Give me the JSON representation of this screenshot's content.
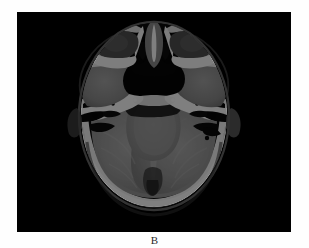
{
  "figure": {
    "panel_label": "B",
    "caption_position": "below",
    "modality": "CT",
    "view": "axial",
    "body_region": "head-skull-base",
    "background_color": "#ffffff",
    "panel_background_color": "#000000"
  },
  "panel": {
    "x": 17,
    "y": 12,
    "width": 274,
    "height": 220
  },
  "image_content": {
    "description": "Axial non-contrast CT of the head at the level of the skull base and posterior fossa",
    "window": "brain-and-bone",
    "orientation_note": "patient left on image right",
    "structures": [
      {
        "name": "scalp-soft-tissue-rim",
        "density": "soft-tissue",
        "tone": "#3a3a3a"
      },
      {
        "name": "frontal-nasal-bone",
        "density": "bone",
        "tone": "#f5f5f5"
      },
      {
        "name": "nasal-cavity-air",
        "density": "air",
        "tone": "#050505"
      },
      {
        "name": "ethmoid-air-cells",
        "density": "air",
        "tone": "#0a0a0a"
      },
      {
        "name": "left-orbit-globe",
        "density": "soft-tissue",
        "tone": "#545454"
      },
      {
        "name": "right-orbit-globe",
        "density": "soft-tissue",
        "tone": "#545454"
      },
      {
        "name": "sphenoid-sinus-air",
        "density": "air",
        "tone": "#060606"
      },
      {
        "name": "left-temporal-lobe",
        "density": "brain",
        "tone": "#8e8e8e"
      },
      {
        "name": "right-temporal-lobe",
        "density": "brain",
        "tone": "#8e8e8e"
      },
      {
        "name": "left-petrous-temporal-bone",
        "density": "bone",
        "tone": "#fafafa"
      },
      {
        "name": "right-petrous-temporal-bone",
        "density": "bone",
        "tone": "#fafafa"
      },
      {
        "name": "left-mastoid-air-cells",
        "density": "air",
        "tone": "#080808"
      },
      {
        "name": "right-mastoid-air-cells",
        "density": "air",
        "tone": "#080808"
      },
      {
        "name": "brainstem-pons",
        "density": "brain",
        "tone": "#969696"
      },
      {
        "name": "fourth-ventricle",
        "density": "csf",
        "tone": "#6a6a6a"
      },
      {
        "name": "left-cerebellar-hemisphere",
        "density": "brain",
        "tone": "#9c9c9c"
      },
      {
        "name": "right-cerebellar-hemisphere",
        "density": "brain",
        "tone": "#9c9c9c"
      },
      {
        "name": "occipital-bone",
        "density": "bone",
        "tone": "#fbfbfb"
      },
      {
        "name": "prepontine-cistern",
        "density": "csf",
        "tone": "#2a2a2a"
      }
    ],
    "tones": {
      "air": "#040404",
      "csf": "#5c5c5c",
      "brain_gray": "#9a9a9a",
      "brain_white": "#8a8a8a",
      "soft_tissue": "#4a4a4a",
      "bone": "#f8f8f8",
      "scalp": "#333333"
    }
  }
}
